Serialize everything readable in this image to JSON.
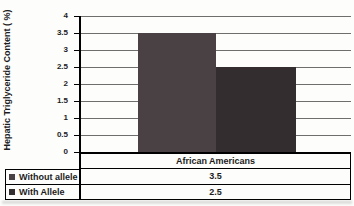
{
  "chart_data": {
    "type": "bar",
    "categories": [
      "African Americans"
    ],
    "series": [
      {
        "name": "Without allele",
        "values": [
          3.5
        ],
        "color": "#4a4144"
      },
      {
        "name": "With Allele",
        "values": [
          2.5
        ],
        "color": "#342d30"
      }
    ],
    "title": "",
    "xlabel": "",
    "ylabel": "Hepatic Triglyceride Content ( %)",
    "ylim": [
      0,
      4
    ],
    "ytick_step": 0.5,
    "yticks": [
      "4",
      "3.5",
      "3",
      "2.5",
      "2",
      "1.5",
      "1",
      "0.5",
      "0"
    ],
    "grid": true,
    "legend_position": "data-table-left",
    "data_table_shown": true,
    "colors": {
      "gridline": "#6e6e6e",
      "axis": "#000000",
      "text": "#1c1c1c"
    }
  }
}
